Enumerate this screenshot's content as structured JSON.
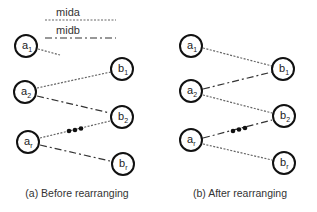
{
  "legend": {
    "items": [
      {
        "label": "mida",
        "style": "dotted"
      },
      {
        "label": "midb",
        "style": "dash-dot"
      }
    ]
  },
  "panels": [
    {
      "id": "a",
      "caption": "(a) Before rearranging",
      "nodes": [
        {
          "base": "a",
          "sub": "1"
        },
        {
          "base": "a",
          "sub": "2"
        },
        {
          "base": "a",
          "sub": "r"
        },
        {
          "base": "b",
          "sub": "1"
        },
        {
          "base": "b",
          "sub": "2"
        },
        {
          "base": "b",
          "sub": "r"
        }
      ],
      "edges": [
        {
          "from": "a1",
          "to": "partial",
          "style": "mida"
        },
        {
          "from": "a2",
          "to": "b1",
          "style": "mida"
        },
        {
          "from": "a2",
          "to": "b2",
          "style": "midb"
        },
        {
          "from": "ar",
          "to": "b2",
          "style": "mida"
        },
        {
          "from": "ar",
          "to": "br",
          "style": "midb"
        }
      ],
      "ellipsis": "•••"
    },
    {
      "id": "b",
      "caption": "(b) After rearranging",
      "nodes": [
        {
          "base": "a",
          "sub": "1"
        },
        {
          "base": "a",
          "sub": "2"
        },
        {
          "base": "a",
          "sub": "r"
        },
        {
          "base": "b",
          "sub": "1"
        },
        {
          "base": "b",
          "sub": "2"
        },
        {
          "base": "b",
          "sub": "r"
        }
      ],
      "edges": [
        {
          "from": "a1",
          "to": "b1",
          "style": "mida"
        },
        {
          "from": "a2",
          "to": "b1",
          "style": "midb"
        },
        {
          "from": "a2",
          "to": "b2",
          "style": "mida"
        },
        {
          "from": "ar",
          "to": "b2",
          "style": "midb"
        },
        {
          "from": "ar",
          "to": "br",
          "style": "mida"
        }
      ],
      "ellipsis": "•••"
    }
  ]
}
